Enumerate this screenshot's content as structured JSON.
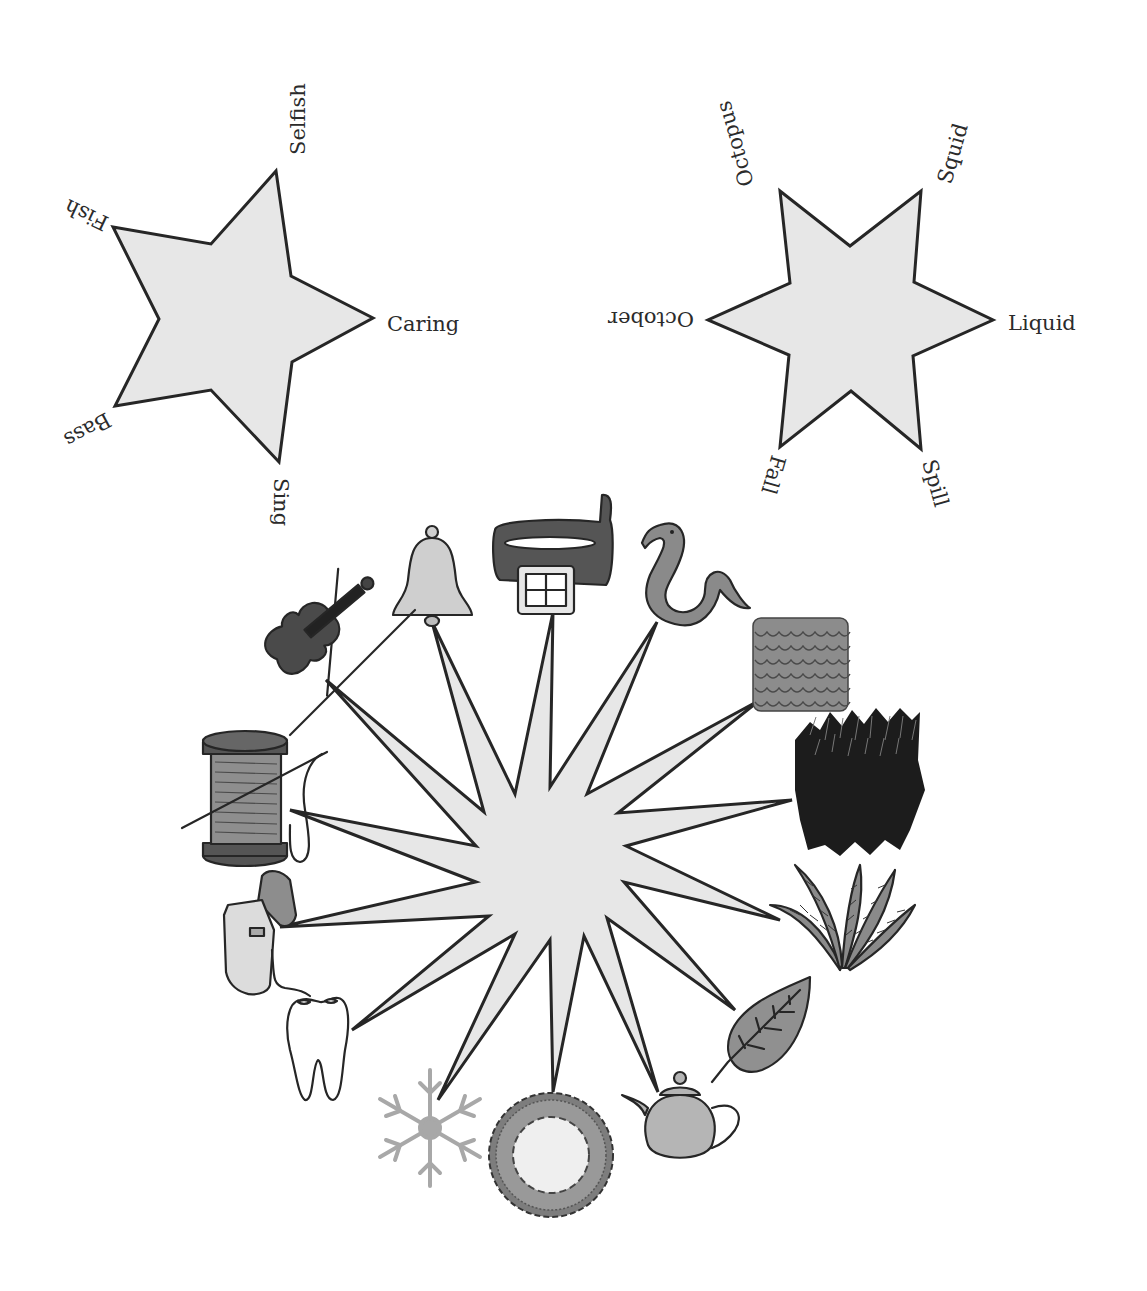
{
  "diagram": {
    "type": "word-association-stars",
    "colors": {
      "star_fill": "#e7e7e7",
      "star_stroke": "#262626",
      "label_text": "#2b2b2b",
      "background": "#ffffff"
    },
    "five_point_star": {
      "labels": [
        "Selfish",
        "Caring",
        "Sing",
        "Bass",
        "Fish"
      ]
    },
    "six_point_star": {
      "labels": [
        "Squid",
        "Liquid",
        "Spill",
        "Fall",
        "October",
        "Octopus"
      ]
    },
    "picture_star": {
      "rays": 14,
      "items": [
        "Violin",
        "Bell",
        "Belt",
        "Snake",
        "Scales",
        "Fur",
        "Fern",
        "Leaf",
        "Teapot",
        "Doily",
        "Snowflake",
        "Tooth",
        "Dental floss",
        "Spool of thread"
      ]
    }
  }
}
